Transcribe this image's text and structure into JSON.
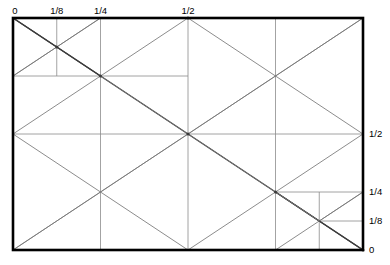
{
  "figure": {
    "title": "",
    "colors": {
      "frame": "#000000",
      "grid": "#8c8c8c",
      "diagonal": "#777777",
      "diagonal_dark": "#3a3a3a",
      "background": "#ffffff",
      "label": "#000000"
    },
    "frame": {
      "x0": 13,
      "y0": 18,
      "x1": 363,
      "y1": 250,
      "stroke_width": 2.6
    },
    "axes": {
      "top": {
        "name": "top-axis",
        "ticks": [
          {
            "label": "0",
            "value": 0
          },
          {
            "label": "1/8",
            "value": 0.125
          },
          {
            "label": "1/4",
            "value": 0.25
          },
          {
            "label": "1/2",
            "value": 0.5
          }
        ]
      },
      "right": {
        "name": "right-axis",
        "ticks": [
          {
            "label": "1/2",
            "value": 0.5
          },
          {
            "label": "1/4",
            "value": 0.25
          },
          {
            "label": "1/8",
            "value": 0.125
          },
          {
            "label": "0",
            "value": 0
          }
        ]
      }
    },
    "grid_lines": {
      "vertical": [
        {
          "name": "v-eighth",
          "x": 0.125,
          "y_from": 0.0,
          "y_to": 0.25
        },
        {
          "name": "v-quarter",
          "x": 0.25,
          "y_from": 0.0,
          "y_to": 1.0
        },
        {
          "name": "v-half",
          "x": 0.5,
          "y_from": 0.0,
          "y_to": 1.0
        },
        {
          "name": "v-three-quarter",
          "x": 0.75,
          "y_from": 0.0,
          "y_to": 1.0
        },
        {
          "name": "v-seven-eighth",
          "x": 0.875,
          "y_from": 0.75,
          "y_to": 1.0
        }
      ],
      "horizontal": [
        {
          "name": "h-quarter-top",
          "y": 0.25,
          "x_from": 0.0,
          "x_to": 0.5
        },
        {
          "name": "h-half",
          "y": 0.5,
          "x_from": 0.0,
          "x_to": 1.0
        },
        {
          "name": "h-quarter-bottom",
          "y": 0.75,
          "x_from": 0.75,
          "x_to": 1.0
        },
        {
          "name": "h-eighth-bottom",
          "y": 0.875,
          "x_from": 0.875,
          "x_to": 1.0
        }
      ]
    },
    "diagonals": [
      {
        "name": "main-diagonal-tl-br",
        "x1": 0.0,
        "y1": 0.0,
        "x2": 1.0,
        "y2": 1.0,
        "weight": "heavy"
      },
      {
        "name": "main-diagonal-bl-tr",
        "x1": 0.0,
        "y1": 1.0,
        "x2": 1.0,
        "y2": 0.0,
        "weight": "light"
      },
      {
        "name": "half-diag-top-left-down",
        "x1": 0.0,
        "y1": 0.5,
        "x2": 0.5,
        "y2": 0.0,
        "weight": "light"
      },
      {
        "name": "half-diag-top-left-up",
        "x1": 0.0,
        "y1": 0.0,
        "x2": 0.5,
        "y2": 0.5,
        "weight": "light"
      },
      {
        "name": "half-diag-mid-right-up",
        "x1": 0.5,
        "y1": 0.0,
        "x2": 1.0,
        "y2": 0.5,
        "weight": "light"
      },
      {
        "name": "half-diag-mid-right-down",
        "x1": 0.5,
        "y1": 0.5,
        "x2": 1.0,
        "y2": 0.0,
        "weight": "light"
      },
      {
        "name": "half-diag-bottom-left-up",
        "x1": 0.0,
        "y1": 1.0,
        "x2": 0.5,
        "y2": 0.5,
        "weight": "light"
      },
      {
        "name": "half-diag-bottom-left-down",
        "x1": 0.0,
        "y1": 0.5,
        "x2": 0.5,
        "y2": 1.0,
        "weight": "light"
      },
      {
        "name": "half-diag-bottom-right-up",
        "x1": 0.5,
        "y1": 1.0,
        "x2": 1.0,
        "y2": 0.5,
        "weight": "light"
      },
      {
        "name": "half-diag-bottom-right-down",
        "x1": 0.5,
        "y1": 0.5,
        "x2": 1.0,
        "y2": 1.0,
        "weight": "light"
      },
      {
        "name": "quarter-diag-tl-down",
        "x1": 0.0,
        "y1": 0.25,
        "x2": 0.25,
        "y2": 0.0,
        "weight": "light"
      },
      {
        "name": "quarter-diag-tl-up",
        "x1": 0.0,
        "y1": 0.0,
        "x2": 0.25,
        "y2": 0.25,
        "weight": "heavy"
      },
      {
        "name": "eighth-diag-tl-down",
        "x1": 0.0,
        "y1": 0.25,
        "x2": 0.125,
        "y2": 0.125,
        "weight": "light"
      },
      {
        "name": "eighth-diag-tl-up",
        "x1": 0.125,
        "y1": 0.125,
        "x2": 0.25,
        "y2": 0.0,
        "weight": "light"
      },
      {
        "name": "quarter-diag-br-up",
        "x1": 0.75,
        "y1": 1.0,
        "x2": 1.0,
        "y2": 0.75,
        "weight": "light"
      },
      {
        "name": "quarter-diag-br-down",
        "x1": 0.75,
        "y1": 0.75,
        "x2": 1.0,
        "y2": 1.0,
        "weight": "heavy"
      },
      {
        "name": "eighth-diag-br-up",
        "x1": 0.875,
        "y1": 0.875,
        "x2": 1.0,
        "y2": 0.75,
        "weight": "light"
      },
      {
        "name": "eighth-diag-br-down",
        "x1": 0.75,
        "y1": 0.75,
        "x2": 0.875,
        "y2": 0.875,
        "weight": "light"
      }
    ],
    "nodes": [
      {
        "name": "node-eighth-top-left",
        "x": 0.125,
        "y": 0.125
      },
      {
        "name": "node-quarter-top-left",
        "x": 0.25,
        "y": 0.25
      },
      {
        "name": "node-center",
        "x": 0.5,
        "y": 0.5
      },
      {
        "name": "node-quarter-bottom-right",
        "x": 0.75,
        "y": 0.75
      },
      {
        "name": "node-top-half",
        "x": 0.5,
        "y": 0.0
      },
      {
        "name": "node-bottom-right",
        "x": 1.0,
        "y": 1.0
      }
    ]
  }
}
